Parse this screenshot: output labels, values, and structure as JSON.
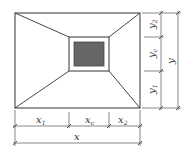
{
  "diagram": {
    "type": "plan-view-dimension-drawing",
    "colors": {
      "line": "#333333",
      "fill": "#666666",
      "dim": "#555555"
    },
    "outer": {
      "x": 15,
      "y": 13,
      "w": 125,
      "h": 95
    },
    "inner": {
      "x": 69,
      "y": 37,
      "w": 40,
      "h": 34
    },
    "core": {
      "x": 74,
      "y": 42,
      "w": 30,
      "h": 24
    },
    "labels": {
      "x1": {
        "main": "x",
        "sub": "1"
      },
      "xc": {
        "main": "x",
        "sub": "c"
      },
      "x2": {
        "main": "x",
        "sub": "2"
      },
      "x": {
        "main": "x"
      },
      "y1": {
        "main": "y",
        "sub": "1"
      },
      "yc": {
        "main": "y",
        "sub": "c"
      },
      "y2": {
        "main": "y",
        "sub": "2"
      },
      "y": {
        "main": "y"
      }
    }
  }
}
